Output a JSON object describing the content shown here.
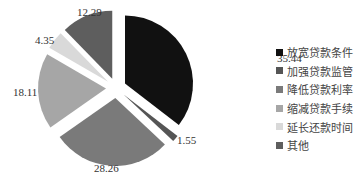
{
  "chart_data": {
    "type": "pie",
    "title": "",
    "exploded": true,
    "start_angle": "12 o'clock, clockwise",
    "legend_position": "right",
    "categories": [
      "放宽贷款条件",
      "加强贷款监管",
      "降低贷款利率",
      "缩减贷款手续",
      "延长还款时间",
      "其他"
    ],
    "values": [
      35.44,
      1.55,
      28.26,
      18.11,
      4.35,
      12.29
    ],
    "value_labels": [
      "35.44",
      "1.55",
      "28.26",
      "18.11",
      "4.35",
      "12.29"
    ],
    "colors": [
      "#111111",
      "#555555",
      "#7a7a7a",
      "#a6a6a6",
      "#d9d9d9",
      "#5e5e5e"
    ]
  },
  "legend": {
    "items": [
      {
        "label": "放宽贷款条件",
        "color": "#111111"
      },
      {
        "label": "加强贷款监管",
        "color": "#555555"
      },
      {
        "label": "降低贷款利率",
        "color": "#7a7a7a"
      },
      {
        "label": "缩减贷款手续",
        "color": "#a6a6a6"
      },
      {
        "label": "延长还款时间",
        "color": "#d9d9d9"
      },
      {
        "label": "其他",
        "color": "#5e5e5e"
      }
    ]
  }
}
